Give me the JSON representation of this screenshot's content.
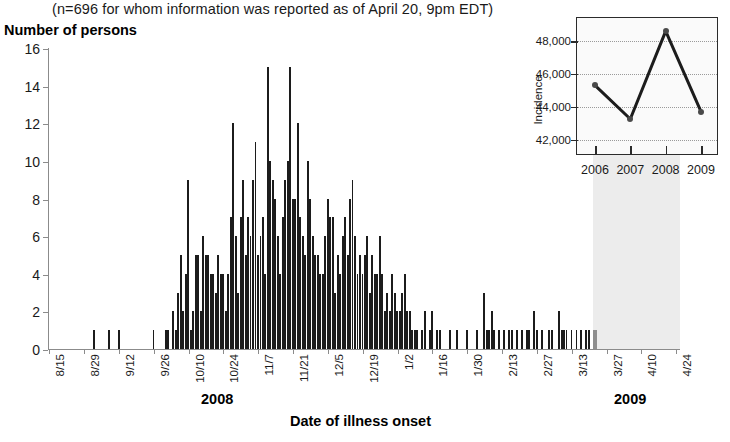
{
  "header": {
    "subtitle": "(n=696 for whom information was reported as of April 20, 9pm EDT)"
  },
  "main_axis": {
    "ylabel": "Number of persons",
    "xlabel": "Date of illness onset",
    "year_left": "2008",
    "year_right": "2009"
  },
  "inset_axis": {
    "ylabel": "Incidence"
  },
  "chart_data": [
    {
      "type": "bar",
      "title": "",
      "xlabel": "Date of illness onset",
      "ylabel": "Number of persons",
      "ylim": [
        0,
        16
      ],
      "yticks": [
        0,
        2,
        4,
        6,
        8,
        10,
        12,
        14,
        16
      ],
      "grid": false,
      "legend": "none",
      "xtick_labels": [
        "8/15",
        "8/29",
        "9/12",
        "9/26",
        "10/10",
        "10/24",
        "11/7",
        "11/21",
        "12/5",
        "12/19",
        "1/2",
        "1/16",
        "1/30",
        "2/13",
        "2/27",
        "3/13",
        "3/27",
        "4/10",
        "4/24"
      ],
      "xtick_indices": [
        0,
        14,
        28,
        42,
        56,
        70,
        84,
        98,
        112,
        126,
        140,
        154,
        168,
        182,
        196,
        210,
        224,
        238,
        252
      ],
      "year_groups": [
        {
          "label": "2008",
          "start_index": 0,
          "end_index": 138
        },
        {
          "label": "2009",
          "start_index": 139,
          "end_index": 253
        }
      ],
      "shaded_region": {
        "label": "incomplete reporting",
        "start_index": 219,
        "end_index": 253,
        "color": "#ececec"
      },
      "bar_color": "#1c1c1c",
      "recent_bar_color": "#8e8e8e",
      "recent_start_index": 219,
      "values": [
        0,
        0,
        0,
        0,
        0,
        0,
        0,
        0,
        0,
        0,
        0,
        0,
        0,
        0,
        0,
        0,
        0,
        0,
        1,
        0,
        0,
        0,
        0,
        0,
        1,
        0,
        0,
        0,
        1,
        0,
        0,
        0,
        0,
        0,
        0,
        0,
        0,
        0,
        0,
        0,
        0,
        0,
        1,
        0,
        0,
        0,
        0,
        1,
        1,
        0,
        2,
        1,
        3,
        5,
        2,
        4,
        9,
        1,
        2,
        5,
        5,
        2,
        6,
        5,
        5,
        4,
        4,
        3,
        5,
        4,
        4,
        2,
        4,
        7,
        12,
        6,
        3,
        7,
        9,
        5,
        7,
        6,
        9,
        11,
        5,
        6,
        7,
        4,
        15,
        10,
        9,
        8,
        6,
        4,
        7,
        9,
        10,
        15,
        8,
        8,
        12,
        7,
        6,
        5,
        10,
        8,
        6,
        5,
        5,
        4,
        4,
        6,
        8,
        7,
        7,
        3,
        5,
        4,
        6,
        7,
        5,
        8,
        9,
        6,
        4,
        5,
        4,
        5,
        6,
        3,
        5,
        4,
        4,
        6,
        4,
        2,
        3,
        2,
        4,
        3,
        2,
        2,
        3,
        4,
        2,
        2,
        1,
        1,
        1,
        0,
        1,
        2,
        0,
        1,
        2,
        0,
        1,
        1,
        0,
        0,
        0,
        1,
        0,
        0,
        1,
        0,
        0,
        0,
        1,
        0,
        0,
        0,
        1,
        0,
        0,
        3,
        1,
        1,
        2,
        1,
        0,
        1,
        0,
        1,
        0,
        1,
        1,
        0,
        1,
        0,
        1,
        0,
        1,
        1,
        0,
        2,
        1,
        0,
        1,
        0,
        0,
        1,
        1,
        0,
        0,
        2,
        1,
        1,
        1,
        0,
        1,
        0,
        1,
        0,
        1,
        0,
        1,
        1,
        0,
        1,
        1,
        0,
        0,
        0,
        0,
        0,
        0,
        0,
        0,
        0,
        0,
        0,
        0,
        0,
        0,
        0,
        0,
        0,
        0,
        0,
        0,
        0,
        0,
        0,
        0,
        0,
        0,
        0,
        0,
        0,
        0,
        0,
        0,
        0
      ]
    },
    {
      "type": "line",
      "title": "",
      "xlabel": "",
      "ylabel": "Incidence",
      "categories": [
        "2006",
        "2007",
        "2008",
        "2009"
      ],
      "values": [
        45300,
        43250,
        48600,
        43700
      ],
      "ylim": [
        41000,
        49400
      ],
      "yticks": [
        42000,
        44000,
        46000,
        48000
      ],
      "ytick_labels": [
        "42,000",
        "44,000",
        "46,000",
        "48,000"
      ],
      "grid": true,
      "legend": "none",
      "line_color": "#1c1c1c",
      "marker_color": "#4a4a4a"
    }
  ]
}
